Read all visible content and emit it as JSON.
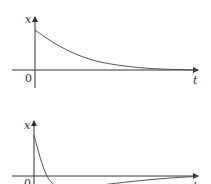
{
  "figure": {
    "panels": [
      {
        "id": "top",
        "y_label": "x",
        "x_label": "t",
        "origin_label": "0",
        "description": "overdamped / exponential decay to zero"
      },
      {
        "id": "bottom",
        "y_label": "x",
        "x_label": "t",
        "origin_label": "0",
        "description": "fast decay crossing zero once, undershoot, then slow return to zero"
      }
    ],
    "colors": {
      "axis": "#333333",
      "curve": "#555555",
      "background": "#ffffff"
    }
  }
}
